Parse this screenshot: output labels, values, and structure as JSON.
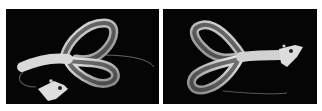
{
  "images": [
    {
      "label": "Soft plastic twin-tail lure with jig head, view 1",
      "background": "#050505"
    },
    {
      "label": "Soft plastic twin-tail lure with jig head, view 2",
      "background": "#050505"
    }
  ],
  "colors": {
    "page_background": "#ffffff",
    "lure_body": "#cfcfcf",
    "lure_edge": "#f2f2f2",
    "jig_head": "#dcdcdc"
  }
}
